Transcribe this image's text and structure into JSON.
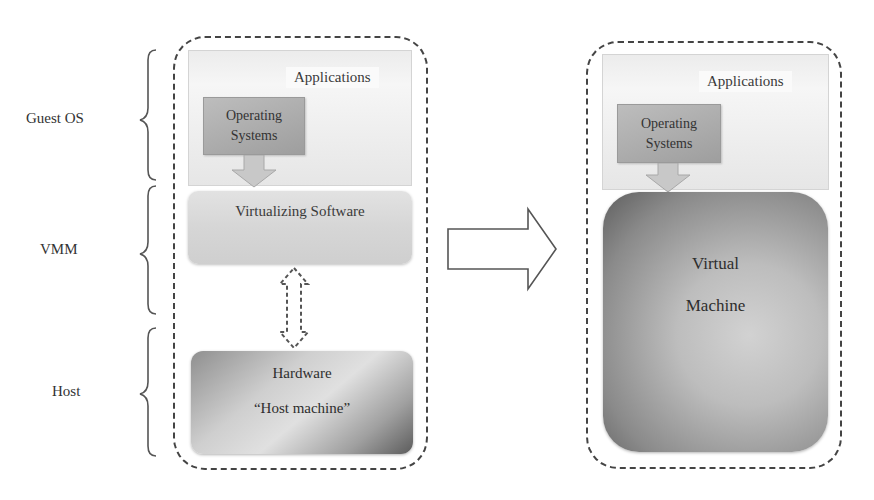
{
  "diagram": {
    "title": "",
    "layer_labels": [
      {
        "label": "Guest OS"
      },
      {
        "label": "VMM"
      },
      {
        "label": "Host"
      }
    ],
    "left_stack": {
      "applications_label": "Applications",
      "operating_systems_label_line1": "Operating",
      "operating_systems_label_line2": "Systems",
      "virtualizing_software_label": "Virtualizing Software",
      "hardware_label": "Hardware",
      "host_machine_label": "“Host machine”"
    },
    "transition_arrow": "right-arrow",
    "right_stack": {
      "applications_label": "Applications",
      "operating_systems_label_line1": "Operating",
      "operating_systems_label_line2": "Systems",
      "virtual_machine_label_line1": "Virtual",
      "virtual_machine_label_line2": "Machine"
    },
    "colors": {
      "dashed_border": "#444444",
      "apps_fill": "#ececec",
      "os_fill": "#aaaaaa",
      "hardware_dark": "#5c5c5c",
      "vm_dark": "#5e5e5e"
    }
  }
}
